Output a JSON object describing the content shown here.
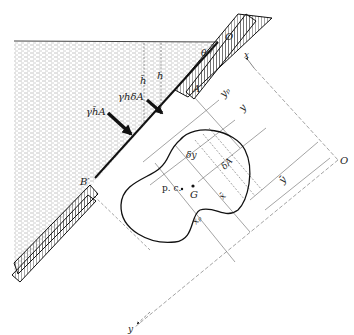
{
  "diagram": {
    "colors": {
      "ink": "#1a1a1a",
      "thin": "#555555",
      "water_hatch": "#b0b0b0",
      "background": "#ffffff"
    },
    "labels": {
      "origin_top": "O",
      "theta": "θ",
      "x_axis": "x",
      "point_a": "A′",
      "point_b": "B′",
      "h_bar": "h̄",
      "h": "h",
      "force_element": "γhδA",
      "force_resultant": "γh̄A",
      "y_p": "yₚ",
      "y": "y",
      "y_bar": "ȳ",
      "origin_right": "O",
      "delta_y": "δy",
      "delta_a": "δA",
      "centroid": "G",
      "pressure_centre": "p. c.",
      "x_bar": "x̄",
      "x_p": "xₚ",
      "y_axis": "y"
    }
  }
}
